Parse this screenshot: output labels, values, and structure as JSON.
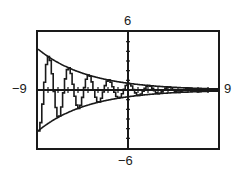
{
  "chart_data": {
    "type": "line",
    "title": "",
    "xlabel": "",
    "ylabel": "",
    "xlim": [
      -9,
      9
    ],
    "ylim": [
      -6,
      6
    ],
    "x_tick_step": 1,
    "y_tick_step": 1,
    "grid": false,
    "legend": null,
    "window_labels": {
      "xmin": "−9",
      "xmax": "9",
      "ymin": "−6",
      "ymax": "6"
    },
    "series": [
      {
        "name": "damped oscillation",
        "formula": "0.7*exp(-0.2x)*cos(pi*x)",
        "style": "step-line"
      },
      {
        "name": "upper envelope",
        "formula": "0.7*exp(-0.2x)"
      },
      {
        "name": "lower envelope",
        "formula": "-0.7*exp(-0.2x)"
      }
    ],
    "sample_points": {
      "x": [
        -9,
        -8,
        -7,
        -6,
        -5,
        -4,
        -3,
        -2,
        -1,
        0,
        1,
        2,
        3,
        4,
        5,
        6,
        7,
        8,
        9
      ],
      "upper_envelope": [
        4.23,
        3.47,
        2.84,
        2.32,
        1.9,
        1.56,
        1.28,
        1.04,
        0.85,
        0.7,
        0.57,
        0.47,
        0.38,
        0.31,
        0.26,
        0.21,
        0.17,
        0.14,
        0.12
      ]
    }
  },
  "colors": {
    "line": "#1a1a1a",
    "background": "#ffffff"
  }
}
